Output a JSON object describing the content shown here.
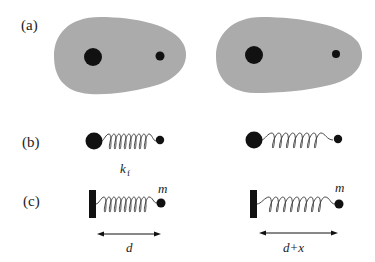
{
  "figure": {
    "panels": [
      {
        "id": "a",
        "label": "(a)",
        "description": "Two molecules (grey electron clouds) each containing a large and a small nucleus"
      },
      {
        "id": "b",
        "label": "(b)",
        "description": "Nuclei connected by a spring of force constant k_f; right spring stretched"
      },
      {
        "id": "c",
        "label": "(c)",
        "description": "Mass m attached to a wall via spring; equilibrium length d vs stretched d+x"
      }
    ],
    "annotations": {
      "spring_constant": "k",
      "spring_constant_subscript": "f",
      "mass": "m",
      "length_left": "d",
      "length_right": "d+x"
    },
    "colors": {
      "cloud": "#ababab",
      "nucleus": "#111111",
      "background": "#ffffff"
    }
  }
}
